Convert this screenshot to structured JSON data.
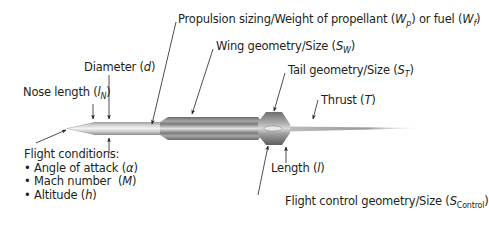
{
  "diagram": {
    "labels": {
      "propulsion": {
        "text": "Propulsion sizing/Weight of propellant (",
        "sym1": "W",
        "sub1": "p",
        "mid": ") or fuel (",
        "sym2": "W",
        "sub2": "f",
        "end": ")"
      },
      "wing": {
        "text": "Wing geometry/Size (",
        "sym": "S",
        "sub": "W",
        "end": ")"
      },
      "diameter": {
        "text": "Diameter (",
        "sym": "d",
        "end": ")"
      },
      "nose_length": {
        "text": "Nose length (",
        "sym": "l",
        "sub": "N",
        "end": ")"
      },
      "tail": {
        "text": "Tail geometry/Size (",
        "sym": "S",
        "sub": "T",
        "end": ")"
      },
      "thrust": {
        "text": "Thrust (",
        "sym": "T",
        "end": ")"
      },
      "length": {
        "text": "Length (",
        "sym": "l",
        "end": ")"
      },
      "flight_control": {
        "text": "Flight control geometry/Size (",
        "sym": "S",
        "sub": "Control",
        "end": ")"
      }
    },
    "flight_conditions": {
      "title": "Flight conditions:",
      "items": [
        {
          "bullet": "•",
          "text": "Angle of attack (",
          "sym": "α",
          "end": ")"
        },
        {
          "bullet": "•",
          "text": "Mach number  (",
          "sym": "M",
          "end": ")"
        },
        {
          "bullet": "•",
          "text": "Altitude (",
          "sym": "h",
          "end": ")"
        }
      ]
    },
    "colors": {
      "text": "#231f20",
      "body_light": "#e6e6e6",
      "body_dark": "#8c8c8c",
      "wing_dark": "#6e6e6e",
      "plume": "#9a9a9a"
    }
  }
}
